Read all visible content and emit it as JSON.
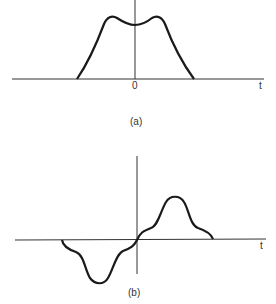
{
  "figure_a": {
    "caption": "(a)",
    "origin_label": "0",
    "axis_label": "t",
    "description": "Even pulse with two symmetric humps and a central dip"
  },
  "figure_b": {
    "caption": "(b)",
    "axis_label": "t",
    "description": "Odd function: negative lobe left of origin, positive lobe right of origin"
  },
  "colors": {
    "stroke": "#1a1a1a",
    "axis": "#333333",
    "background": "#ffffff"
  }
}
